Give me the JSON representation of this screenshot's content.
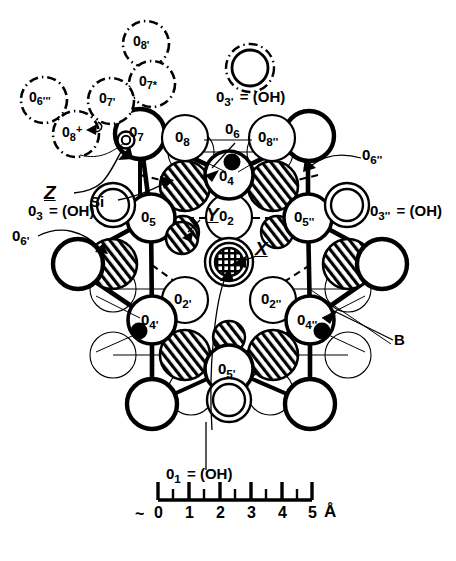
{
  "figure": {
    "kind": "crystal-structure-diagram",
    "colors": {
      "ink": "#000000",
      "paper": "#ffffff"
    }
  },
  "legend": {
    "o3prime_top": {
      "label_main": "0",
      "sub": "3'",
      "equals": "= (OH)",
      "text": "0₃' = (OH)",
      "marker": "double-dashdot-circle"
    },
    "o3_left": {
      "label_main": "0",
      "sub": "3",
      "equals": "= (OH)",
      "text": "0₃ = (OH)",
      "marker": "double-circle"
    },
    "o3dprime_right": {
      "label_main": "0",
      "sub": "3''",
      "equals": "= (OH)",
      "text": "0₃'' = (OH)",
      "marker": "double-circle"
    },
    "o1_bottom": {
      "label_main": "0",
      "sub": "1",
      "equals": "= (OH)",
      "text": "0₁ = (OH)",
      "marker": "double-circle"
    }
  },
  "ghost_atoms": [
    {
      "name": "O8'",
      "main": "0",
      "sub": "8'",
      "cx": 146,
      "cy": 44,
      "r": 23
    },
    {
      "name": "O7*",
      "main": "0",
      "sub": "7*",
      "cx": 152,
      "cy": 84,
      "r": 23
    },
    {
      "name": "O6'''",
      "main": "0",
      "sub": "6'''",
      "cx": 44,
      "cy": 100,
      "r": 23
    },
    {
      "name": "O7'",
      "main": "0",
      "sub": "7'",
      "cx": 111,
      "cy": 101,
      "r": 23
    },
    {
      "name": "O8+",
      "main": "0",
      "sub": "8",
      "supscript": "+",
      "cx": 76,
      "cy": 134,
      "r": 23
    }
  ],
  "labeled_atoms": [
    {
      "name": "O7",
      "main": "0",
      "sub": "7",
      "cx": 140,
      "cy": 134
    },
    {
      "name": "O8",
      "main": "0",
      "sub": "8",
      "cx": 185,
      "cy": 138
    },
    {
      "name": "O8''",
      "main": "0",
      "sub": "8''",
      "cx": 272,
      "cy": 138
    },
    {
      "name": "O4",
      "main": "0",
      "sub": "4",
      "cx": 229,
      "cy": 175
    },
    {
      "name": "O2",
      "main": "0",
      "sub": "2",
      "cx": 229,
      "cy": 217
    },
    {
      "name": "O5",
      "main": "0",
      "sub": "5",
      "cx": 151,
      "cy": 218
    },
    {
      "name": "O5''",
      "main": "0",
      "sub": "5''",
      "cx": 308,
      "cy": 218
    },
    {
      "name": "O2'",
      "main": "0",
      "sub": "2'",
      "cx": 185,
      "cy": 300
    },
    {
      "name": "O2''",
      "main": "0",
      "sub": "2''",
      "cx": 273,
      "cy": 300
    },
    {
      "name": "O4'",
      "main": "0",
      "sub": "4'",
      "cx": 152,
      "cy": 320
    },
    {
      "name": "O4''",
      "main": "0",
      "sub": "4''",
      "cx": 310,
      "cy": 320
    },
    {
      "name": "O5'",
      "main": "0",
      "sub": "5'",
      "cx": 229,
      "cy": 369
    }
  ],
  "callouts": [
    {
      "name": "Z",
      "text": "Z",
      "italic_underline": true,
      "x": 46,
      "y": 192
    },
    {
      "name": "Si",
      "text": "Si",
      "italic_underline": false,
      "x": 95,
      "y": 202
    },
    {
      "name": "Y",
      "text": "Y",
      "italic_underline": true,
      "x": 204,
      "y": 213
    },
    {
      "name": "X",
      "text": "X",
      "italic_underline": true,
      "x": 253,
      "y": 247
    },
    {
      "name": "B",
      "text": "B",
      "italic_underline": false,
      "x": 397,
      "y": 340
    },
    {
      "name": "O6'",
      "main": "0",
      "sub": "6'",
      "x": 14,
      "y": 237
    },
    {
      "name": "O6",
      "main": "0",
      "sub": "6",
      "x": 229,
      "y": 130
    },
    {
      "name": "O6''",
      "main": "0",
      "sub": "6''",
      "x": 364,
      "y": 155
    }
  ],
  "scale_bar": {
    "unit": "Å",
    "prefix": "~",
    "tick_labels": [
      "0",
      "1",
      "2",
      "3",
      "4",
      "5"
    ],
    "minor_ticks_between": 1,
    "x_start": 158,
    "x_end": 312,
    "y_baseline": 500
  }
}
